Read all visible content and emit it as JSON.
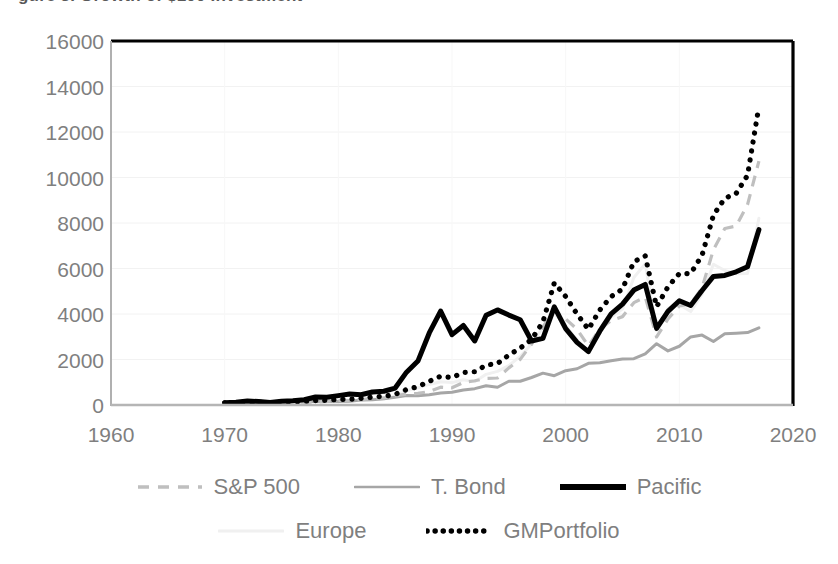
{
  "title": "gure 3. Growth of $100 Investment",
  "axes": {
    "y_ticks": [
      "16000",
      "14000",
      "12000",
      "10000",
      "8000",
      "6000",
      "4000",
      "2000",
      "0"
    ],
    "x_ticks": [
      "1960",
      "1970",
      "1980",
      "1990",
      "2000",
      "2010",
      "2020"
    ],
    "y_label": "",
    "x_label": ""
  },
  "legend": {
    "row1": [
      {
        "label": "S&P 500",
        "key": "dashed-gray-line-icon"
      },
      {
        "label": "T. Bond",
        "key": "solid-lightgray-line-icon"
      },
      {
        "label": "Pacific",
        "key": "solid-black-thick-line-icon"
      }
    ],
    "row2": [
      {
        "label": "Europe",
        "key": "solid-verylight-line-icon"
      },
      {
        "label": "GMPortfolio",
        "key": "dotted-black-line-icon"
      }
    ]
  },
  "colors": {
    "sp500": "#bfbfbf",
    "tbond": "#a6a6a6",
    "pacific": "#000000",
    "europe": "#f0f0f0",
    "gmportfolio": "#000000",
    "frame": "#000000",
    "grid": "#f2f2f2",
    "tick_text": "#7f7f7f"
  },
  "chart_data": {
    "type": "line",
    "title": "Growth of $100 Investment",
    "xlabel": "",
    "ylabel": "",
    "xlim": [
      1960,
      2020
    ],
    "ylim": [
      0,
      16000
    ],
    "y_ticks": [
      0,
      2000,
      4000,
      6000,
      8000,
      10000,
      12000,
      14000,
      16000
    ],
    "x_ticks": [
      1960,
      1970,
      1980,
      1990,
      2000,
      2010,
      2020
    ],
    "grid": true,
    "legend_position": "bottom",
    "x": [
      1970,
      1971,
      1972,
      1973,
      1974,
      1975,
      1976,
      1977,
      1978,
      1979,
      1980,
      1981,
      1982,
      1983,
      1984,
      1985,
      1986,
      1987,
      1988,
      1989,
      1990,
      1991,
      1992,
      1993,
      1994,
      1995,
      1996,
      1997,
      1998,
      1999,
      2000,
      2001,
      2002,
      2003,
      2004,
      2005,
      2006,
      2007,
      2008,
      2009,
      2010,
      2011,
      2012,
      2013,
      2014,
      2015,
      2016,
      2017
    ],
    "series": [
      {
        "name": "S&P 500",
        "style": "dashed",
        "color": "#bfbfbf",
        "values": [
          100,
          104,
          124,
          106,
          78,
          107,
          132,
          123,
          131,
          155,
          206,
          196,
          238,
          291,
          310,
          408,
          484,
          509,
          594,
          782,
          757,
          988,
          1064,
          1171,
          1186,
          1631,
          2005,
          2674,
          3438,
          4161,
          3782,
          3333,
          2596,
          3341,
          3705,
          3885,
          4499,
          4746,
          2991,
          3783,
          4353,
          4446,
          5157,
          6826,
          7759,
          7864,
          8804,
          10717
        ]
      },
      {
        "name": "T. Bond",
        "style": "solid",
        "color": "#a6a6a6",
        "values": [
          100,
          113,
          116,
          120,
          124,
          131,
          152,
          154,
          153,
          155,
          149,
          164,
          216,
          234,
          271,
          342,
          419,
          409,
          450,
          528,
          562,
          660,
          718,
          845,
          778,
          1043,
          1043,
          1209,
          1400,
          1289,
          1510,
          1594,
          1834,
          1860,
          1944,
          2019,
          2036,
          2243,
          2695,
          2379,
          2582,
          2992,
          3073,
          2794,
          3129,
          3155,
          3182,
          3394
        ]
      },
      {
        "name": "Pacific",
        "style": "solid-thick",
        "color": "#000000",
        "values": [
          100,
          125,
          180,
          151,
          113,
          163,
          189,
          229,
          352,
          339,
          412,
          486,
          452,
          570,
          605,
          744,
          1443,
          1931,
          3166,
          4130,
          3093,
          3496,
          2816,
          3941,
          4180,
          3953,
          3746,
          2813,
          2929,
          4314,
          3360,
          2752,
          2347,
          3244,
          4008,
          4432,
          5052,
          5298,
          3365,
          4114,
          4581,
          4371,
          5035,
          5651,
          5697,
          5853,
          6079,
          7707
        ]
      },
      {
        "name": "Europe",
        "style": "solid-faint",
        "color": "#f0f0f0",
        "values": [
          100,
          108,
          125,
          110,
          80,
          110,
          108,
          133,
          162,
          181,
          217,
          193,
          206,
          261,
          263,
          381,
          629,
          754,
          904,
          1025,
          984,
          1113,
          1017,
          1348,
          1477,
          1734,
          2135,
          2684,
          3419,
          4027,
          3484,
          2861,
          2317,
          3163,
          3853,
          4221,
          5602,
          6211,
          3275,
          4252,
          4407,
          4106,
          4871,
          6185,
          5911,
          5774,
          5779,
          8206
        ]
      },
      {
        "name": "GMPortfolio",
        "style": "dotted",
        "color": "#000000",
        "values": [
          100,
          112,
          135,
          124,
          102,
          128,
          146,
          158,
          190,
          208,
          247,
          250,
          290,
          350,
          375,
          470,
          680,
          805,
          1041,
          1265,
          1207,
          1430,
          1463,
          1751,
          1824,
          2195,
          2500,
          2878,
          3650,
          5366,
          4770,
          3999,
          3325,
          4173,
          4765,
          5096,
          6300,
          6552,
          4319,
          5196,
          5776,
          5780,
          6583,
          8344,
          9085,
          9301,
          10095,
          13123
        ]
      }
    ]
  }
}
